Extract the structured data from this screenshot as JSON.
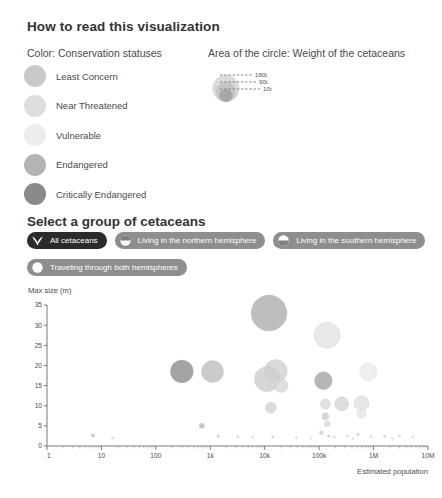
{
  "header": {
    "title": "How to read this visualization",
    "color_legend_title": "Color: Conservation statuses",
    "area_legend_title": "Area of the circle: Weight of the cetaceans"
  },
  "conservation_legend": {
    "items": [
      {
        "label": "Least Concern",
        "color": "#c9c9c9"
      },
      {
        "label": "Near Threatened",
        "color": "#dedede"
      },
      {
        "label": "Vulnerable",
        "color": "#ededed"
      },
      {
        "label": "Endangered",
        "color": "#b4b4b4"
      },
      {
        "label": "Critically Endangered",
        "color": "#8a8a8a"
      }
    ]
  },
  "size_legend": {
    "items": [
      {
        "label": "180t",
        "radius": 13.5,
        "color": "#d5d5d5"
      },
      {
        "label": "90t",
        "radius": 10.0,
        "color": "#c2c2c2"
      },
      {
        "label": "10t",
        "radius": 6.5,
        "color": "#a2a2a2"
      }
    ]
  },
  "selector": {
    "title": "Select a group of cetaceans",
    "buttons": [
      {
        "label": "All cetaceans",
        "icon": "whale-tail-icon",
        "active": true
      },
      {
        "label": "Living in the northern hemisphere",
        "icon": "northern-hemisphere-icon",
        "active": false
      },
      {
        "label": "Living in the southern hemisphere",
        "icon": "southern-hemisphere-icon",
        "active": false
      },
      {
        "label": "Traveling through both hemispheres",
        "icon": "both-hemispheres-icon",
        "active": false
      }
    ]
  },
  "chart_data": {
    "type": "scatter",
    "title": "",
    "xlabel": "Estimated population",
    "ylabel": "Max size (m)",
    "x_scale": "log",
    "xlim": [
      1,
      10000000
    ],
    "ylim": [
      0,
      35
    ],
    "grid": false,
    "legend_position": "none",
    "x_tick_labels": [
      "1",
      "10",
      "100",
      "1k",
      "10k",
      "100k",
      "1M",
      "10M"
    ],
    "x_tick_values": [
      1,
      10,
      100,
      1000,
      10000,
      100000,
      1000000,
      10000000
    ],
    "y_tick_labels": [
      "0",
      "5",
      "10",
      "15",
      "20",
      "25",
      "30",
      "35"
    ],
    "y_tick_values": [
      0,
      5,
      10,
      15,
      20,
      25,
      30,
      35
    ],
    "size_encoding": "weight (tonnes), area proportional",
    "color_encoding": "conservation status",
    "points": [
      {
        "x": 12000,
        "y": 33.0,
        "r": 18.0,
        "color": "#b0b0b0"
      },
      {
        "x": 140000,
        "y": 27.5,
        "r": 13.0,
        "color": "#e4e4e4"
      },
      {
        "x": 300,
        "y": 18.5,
        "r": 11.5,
        "color": "#909090"
      },
      {
        "x": 1100,
        "y": 18.5,
        "r": 11.0,
        "color": "#bfbfbf"
      },
      {
        "x": 16000,
        "y": 18.6,
        "r": 11.5,
        "color": "#d2d2d2"
      },
      {
        "x": 11000,
        "y": 16.6,
        "r": 12.5,
        "color": "#cecece"
      },
      {
        "x": 20000,
        "y": 15.0,
        "r": 7.0,
        "color": "#d8d8d8"
      },
      {
        "x": 120000,
        "y": 16.2,
        "r": 9.0,
        "color": "#a6a6a6"
      },
      {
        "x": 800000,
        "y": 18.4,
        "r": 8.5,
        "color": "#ececec"
      },
      {
        "x": 13000,
        "y": 9.5,
        "r": 5.5,
        "color": "#d4d4d4"
      },
      {
        "x": 130000,
        "y": 10.4,
        "r": 5.0,
        "color": "#dcdcdc"
      },
      {
        "x": 260000,
        "y": 10.5,
        "r": 7.0,
        "color": "#d6d6d6"
      },
      {
        "x": 600000,
        "y": 10.6,
        "r": 7.5,
        "color": "#e2e2e2"
      },
      {
        "x": 600000,
        "y": 8.0,
        "r": 4.5,
        "color": "#e6e6e6"
      },
      {
        "x": 130000,
        "y": 7.4,
        "r": 3.5,
        "color": "#d0d0d0"
      },
      {
        "x": 140000,
        "y": 5.5,
        "r": 3.0,
        "color": "#d9d9d9"
      },
      {
        "x": 700,
        "y": 5.0,
        "r": 2.6,
        "color": "#b9b9b9"
      },
      {
        "x": 110000,
        "y": 3.3,
        "r": 2.0,
        "color": "#cfcfcf"
      },
      {
        "x": 7,
        "y": 2.6,
        "r": 1.7,
        "color": "#c5c5c5"
      },
      {
        "x": 16,
        "y": 2.0,
        "r": 1.1,
        "color": "#dadada"
      },
      {
        "x": 1400,
        "y": 2.4,
        "r": 1.3,
        "color": "#d2d2d2"
      },
      {
        "x": 3200,
        "y": 2.3,
        "r": 1.2,
        "color": "#d8d8d8"
      },
      {
        "x": 6000,
        "y": 2.2,
        "r": 1.0,
        "color": "#dcdcdc"
      },
      {
        "x": 14000,
        "y": 2.2,
        "r": 1.1,
        "color": "#d6d6d6"
      },
      {
        "x": 38000,
        "y": 2.1,
        "r": 1.1,
        "color": "#dddddd"
      },
      {
        "x": 150000,
        "y": 2.5,
        "r": 1.3,
        "color": "#d0d0d0"
      },
      {
        "x": 190000,
        "y": 2.2,
        "r": 1.0,
        "color": "#dadada"
      },
      {
        "x": 330000,
        "y": 2.4,
        "r": 1.1,
        "color": "#d8d8d8"
      },
      {
        "x": 520000,
        "y": 2.9,
        "r": 1.2,
        "color": "#d4d4d4"
      },
      {
        "x": 900000,
        "y": 2.3,
        "r": 1.0,
        "color": "#dcdcdc"
      },
      {
        "x": 1600000,
        "y": 2.4,
        "r": 1.2,
        "color": "#d6d6d6"
      },
      {
        "x": 3000000,
        "y": 2.5,
        "r": 1.1,
        "color": "#d9d9d9"
      },
      {
        "x": 5200000,
        "y": 2.3,
        "r": 1.0,
        "color": "#dddddd"
      },
      {
        "x": 70000,
        "y": 1.9,
        "r": 0.9,
        "color": "#e0e0e0"
      },
      {
        "x": 420000,
        "y": 1.8,
        "r": 0.9,
        "color": "#e0e0e0"
      },
      {
        "x": 2200000,
        "y": 1.9,
        "r": 0.9,
        "color": "#e0e0e0"
      }
    ]
  }
}
